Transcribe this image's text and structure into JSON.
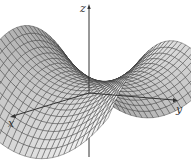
{
  "figure": {
    "surface": {
      "equation": "z = y^2 - x^2",
      "grid_u": 26,
      "grid_v": 26,
      "fill_light": "#f2f2f2",
      "fill_dark": "#9a9a9a",
      "mesh_color": "#2a2a2a"
    },
    "axes": {
      "x": {
        "label": "x"
      },
      "y": {
        "label": "y"
      },
      "z": {
        "label": "z"
      }
    },
    "colors": {
      "background": "#ffffff",
      "axis": "#333333"
    }
  }
}
